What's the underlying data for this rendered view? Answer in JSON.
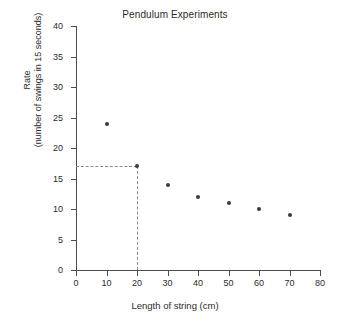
{
  "chart_data": {
    "type": "scatter",
    "title": "Pendulum Experiments",
    "xlabel": "Length of string (cm)",
    "ylabel_line1": "Rate",
    "ylabel_line2": "(number of swings in 15 seconds)",
    "xlim": [
      0,
      80
    ],
    "ylim": [
      0,
      40
    ],
    "xticks": [
      0,
      10,
      20,
      30,
      40,
      50,
      60,
      70,
      80
    ],
    "yticks": [
      0,
      5,
      10,
      15,
      20,
      25,
      30,
      35,
      40
    ],
    "grid": false,
    "legend": "none",
    "point_color": "#3a3a3a",
    "axis_color": "#4d4d4d",
    "guide_color": "#8a8a8a",
    "x": [
      10,
      20,
      30,
      40,
      50,
      60,
      70
    ],
    "values": [
      24,
      17,
      14,
      12,
      11,
      10,
      9
    ],
    "points": [
      {
        "x": 10,
        "y": 24
      },
      {
        "x": 20,
        "y": 17
      },
      {
        "x": 30,
        "y": 14
      },
      {
        "x": 40,
        "y": 12
      },
      {
        "x": 50,
        "y": 11
      },
      {
        "x": 60,
        "y": 10
      },
      {
        "x": 70,
        "y": 9
      }
    ],
    "annotations": [
      {
        "name": "readoff-guideline",
        "style": "dashed",
        "x": 20,
        "y": 17
      }
    ]
  }
}
